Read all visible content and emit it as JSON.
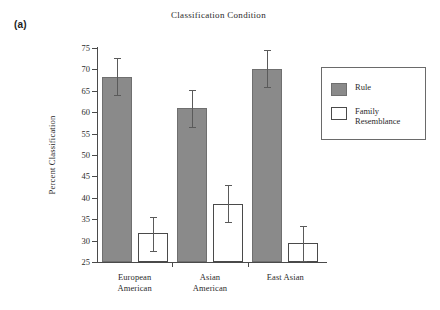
{
  "panel": {
    "label": "(a)"
  },
  "chart_data": {
    "type": "bar",
    "title": "Classification Condition",
    "xlabel": "",
    "ylabel": "Percent Classification",
    "ylim": [
      25,
      75
    ],
    "ytick_step": 5,
    "yticks": [
      25,
      30,
      35,
      40,
      45,
      50,
      55,
      60,
      65,
      70,
      75
    ],
    "ytick_labels": [
      "25",
      "30",
      "35",
      "40",
      "45",
      "50",
      "55",
      "60",
      "65",
      "70",
      "75"
    ],
    "grid": false,
    "legend_position": "right",
    "categories": [
      "European American",
      "Asian American",
      "East Asian"
    ],
    "category_lines": [
      [
        "European",
        "American"
      ],
      [
        "Asian",
        "American"
      ],
      [
        "East Asian"
      ]
    ],
    "series": [
      {
        "name": "Rule",
        "color": "#8a8a8a",
        "values": [
          68.3,
          61.0,
          70.2
        ],
        "errors_low": [
          64.0,
          56.6,
          66.0
        ],
        "errors_high": [
          72.6,
          65.3,
          74.5
        ]
      },
      {
        "name": "Family Resemblance",
        "color": "#ffffff",
        "values": [
          31.8,
          38.6,
          29.5
        ],
        "errors_low": [
          27.5,
          34.3,
          25.3
        ],
        "errors_high": [
          35.4,
          43.0,
          33.5
        ]
      }
    ],
    "legend_entries": [
      {
        "label": "Rule",
        "swatch": "rule"
      },
      {
        "label": "Family\nResemblance",
        "swatch": "family"
      }
    ]
  }
}
